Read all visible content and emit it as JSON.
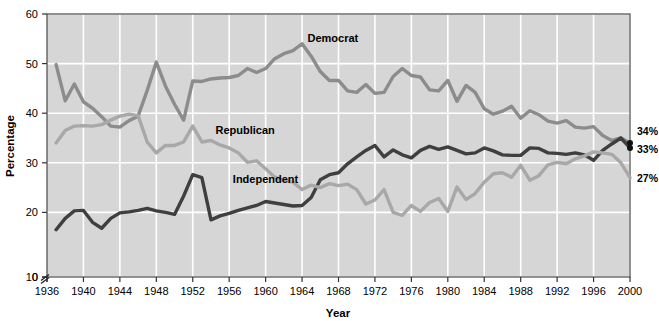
{
  "chart_data": {
    "type": "line",
    "title": "",
    "xlabel": "Year",
    "ylabel": "Percentage",
    "xlim": [
      1936,
      2000
    ],
    "ylim": [
      0,
      60
    ],
    "y_axis_break": true,
    "y_break_between": [
      0,
      10
    ],
    "grid": true,
    "gridline_color": "#ffffff",
    "plot_background": "#d6d6d6",
    "legend_position": "inline-labels",
    "xticks": [
      1936,
      1940,
      1944,
      1948,
      1952,
      1956,
      1960,
      1964,
      1968,
      1972,
      1976,
      1980,
      1984,
      1988,
      1992,
      1996,
      2000
    ],
    "yticks": [
      0,
      10,
      20,
      30,
      40,
      50,
      60
    ],
    "x": [
      1937,
      1938,
      1939,
      1940,
      1941,
      1942,
      1943,
      1944,
      1945,
      1946,
      1947,
      1948,
      1949,
      1950,
      1951,
      1952,
      1953,
      1954,
      1955,
      1956,
      1957,
      1958,
      1959,
      1960,
      1961,
      1962,
      1963,
      1964,
      1965,
      1966,
      1967,
      1968,
      1969,
      1970,
      1971,
      1972,
      1973,
      1974,
      1975,
      1976,
      1977,
      1978,
      1979,
      1980,
      1981,
      1982,
      1983,
      1984,
      1985,
      1986,
      1987,
      1988,
      1989,
      1990,
      1991,
      1992,
      1993,
      1994,
      1995,
      1996,
      1997,
      1998,
      1999,
      2000
    ],
    "series": [
      {
        "name": "Democrat",
        "color": "#8c8c8c",
        "end_label": "34%",
        "end_value": 34,
        "label_x": 1964.6,
        "label_y": 54.4,
        "values": [
          49.8,
          42.5,
          45.9,
          42.3,
          41.0,
          39.3,
          37.4,
          37.2,
          38.5,
          39.4,
          44.6,
          50.3,
          45.5,
          41.8,
          38.6,
          46.5,
          46.4,
          46.9,
          47.1,
          47.2,
          47.6,
          49.0,
          48.2,
          49.0,
          51.0,
          52.0,
          52.6,
          54.0,
          51.5,
          48.4,
          46.6,
          46.6,
          44.5,
          44.2,
          45.8,
          44.0,
          44.2,
          47.4,
          49.0,
          47.6,
          47.3,
          44.7,
          44.5,
          46.6,
          42.4,
          45.6,
          44.2,
          40.9,
          39.8,
          40.4,
          41.4,
          39.0,
          40.5,
          39.7,
          38.4,
          38.0,
          38.5,
          37.2,
          37.0,
          37.3,
          35.5,
          34.5,
          35.0,
          34.0
        ]
      },
      {
        "name": "Independent",
        "color": "#3f3f3f",
        "end_label": "33%",
        "end_value": 33,
        "label_x": 1956.4,
        "label_y": 25.9,
        "values": [
          16.5,
          18.8,
          20.3,
          20.4,
          18.0,
          16.8,
          18.8,
          19.9,
          20.1,
          20.4,
          20.8,
          20.3,
          20.0,
          19.6,
          23.3,
          27.6,
          27.0,
          18.5,
          19.3,
          19.8,
          20.4,
          20.9,
          21.4,
          22.2,
          21.9,
          21.6,
          21.3,
          21.4,
          23.0,
          26.6,
          27.6,
          28.0,
          29.8,
          31.2,
          32.5,
          33.5,
          31.2,
          32.6,
          31.6,
          31.0,
          32.5,
          33.3,
          32.7,
          33.2,
          32.5,
          31.8,
          32.0,
          33.0,
          32.4,
          31.6,
          31.5,
          31.5,
          33.0,
          32.9,
          32.0,
          31.9,
          31.7,
          32.0,
          31.6,
          30.5,
          32.5,
          33.8,
          35.0,
          33.0
        ]
      },
      {
        "name": "Republican",
        "color": "#a8a8a8",
        "end_label": "27%",
        "end_value": 27,
        "label_x": 1954.5,
        "label_y": 35.8,
        "values": [
          34.0,
          36.5,
          37.4,
          37.5,
          37.4,
          37.7,
          38.6,
          39.4,
          39.8,
          39.5,
          34.2,
          32.0,
          33.5,
          33.5,
          34.2,
          37.4,
          34.2,
          34.5,
          33.6,
          33.0,
          32.0,
          30.1,
          30.4,
          28.8,
          27.1,
          26.4,
          26.1,
          24.6,
          25.5,
          25.0,
          25.8,
          25.4,
          25.7,
          24.6,
          21.7,
          22.5,
          24.6,
          20.0,
          19.4,
          21.4,
          20.2,
          22.0,
          22.8,
          20.2,
          25.1,
          22.6,
          23.8,
          26.1,
          27.8,
          28.0,
          27.1,
          29.5,
          26.5,
          27.4,
          29.6,
          30.1,
          29.8,
          30.8,
          31.4,
          32.2,
          32.0,
          31.7,
          30.0,
          27.0
        ]
      }
    ]
  },
  "axis": {
    "y_title": "Percentage",
    "x_title": "Year",
    "y_tick_labels": [
      "60",
      "50",
      "40",
      "30",
      "20",
      "10",
      "0"
    ],
    "x_tick_labels": [
      "1936",
      "1940",
      "1944",
      "1948",
      "1952",
      "1956",
      "1960",
      "1964",
      "1968",
      "1972",
      "1976",
      "1980",
      "1984",
      "1988",
      "1992",
      "1996",
      "2000"
    ]
  },
  "series_labels": {
    "democrat": "Democrat",
    "independent": "Independent",
    "republican": "Republican"
  },
  "end_labels": {
    "democrat": "34%",
    "independent": "33%",
    "republican": "27%"
  }
}
